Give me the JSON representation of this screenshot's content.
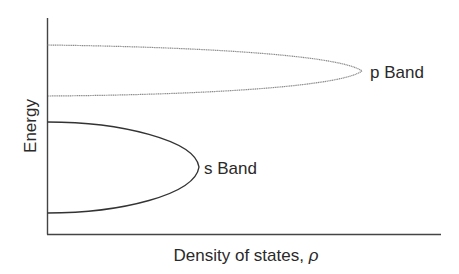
{
  "diagram": {
    "type": "density-of-states band diagram",
    "y_axis_label": "Energy",
    "x_axis_label": "Density of states, ",
    "x_axis_symbol": "ρ",
    "bands": [
      {
        "name": "p Band",
        "label": "p Band",
        "line_style": "dotted",
        "color": "#8a8a8a"
      },
      {
        "name": "s Band",
        "label": "s Band",
        "line_style": "solid",
        "color": "#333333"
      }
    ],
    "axis_color": "#444444"
  }
}
